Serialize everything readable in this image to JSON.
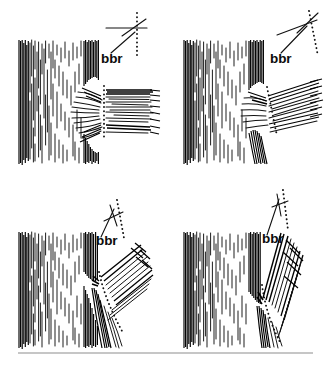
{
  "figure": {
    "background_color": "#ffffff",
    "ink_color": "#111111",
    "width": 331,
    "height": 369,
    "panel_count": 4,
    "footer_rule": {
      "present": true,
      "color": "#8d8d8d",
      "x_start": 18,
      "x_end": 313,
      "y": 353
    }
  },
  "panels": [
    {
      "id": "panel-top-left",
      "position": "top-left",
      "label": "bbr",
      "label_x": 101,
      "label_y": 63,
      "branch_angle_description": "horizontal branch, near 90 degrees to trunk",
      "branch_angle_degrees": 90,
      "bark_ridge_orientation": "horizontal ridge line with vertical dotted collar line",
      "union_type": "wide strong union",
      "trunk_left": 18,
      "trunk_right": 101,
      "dotted_line_description": "vertical dotted line marking branch collar"
    },
    {
      "id": "panel-top-right",
      "position": "top-right",
      "label": "bbr",
      "label_x": 270,
      "label_y": 63,
      "branch_angle_description": "branch rising at roughly 30 degrees above horizontal",
      "branch_angle_degrees": 60,
      "bark_ridge_orientation": "ridge line tilted up to the right with dotted line angled down-right",
      "union_type": "wide strong union",
      "trunk_left": 183,
      "trunk_right": 266,
      "dotted_line_description": "dotted line following the branch collar down and to the right"
    },
    {
      "id": "panel-bottom-left",
      "position": "bottom-left",
      "label": "bbr",
      "label_x": 96,
      "label_y": 245,
      "branch_angle_description": "branch rising at roughly 45 degrees",
      "branch_angle_degrees": 45,
      "bark_ridge_orientation": "steep ridge line with curved dotted collar line",
      "union_type": "moderately narrow union",
      "trunk_left": 18,
      "trunk_right": 98,
      "dotted_line_description": "curved dotted line sweeping from the union down and to the right"
    },
    {
      "id": "panel-bottom-right",
      "position": "bottom-right",
      "label": "bbr",
      "label_x": 262,
      "label_y": 243,
      "branch_angle_description": "branch rising steeply, narrow included-bark union",
      "branch_angle_degrees": 20,
      "bark_ridge_orientation": "near vertical ridge line with long dotted line descending",
      "union_type": "narrow weak union with included bark",
      "trunk_left": 183,
      "trunk_right": 263,
      "dotted_line_description": "long dotted line descending steeply along the union seam"
    }
  ],
  "legend": {
    "abbreviation": "bbr",
    "meaning": "branch bark ridge"
  }
}
